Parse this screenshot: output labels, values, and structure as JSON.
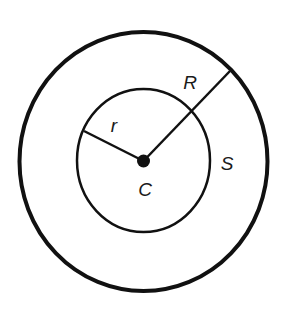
{
  "diagram": {
    "title": "",
    "colors": {
      "stroke": "#111111",
      "background": "#ffffff",
      "label": "#1a1a1a"
    },
    "outer_circle": {
      "name": "S",
      "cx": 143.5,
      "cy": 161.5,
      "rx": 124,
      "ry": 129.5,
      "stroke_width": 4
    },
    "inner_circle": {
      "cx": 143.5,
      "cy": 160.5,
      "rx": 66.5,
      "ry": 71.5,
      "stroke_width": 2.5
    },
    "center": {
      "label": "C",
      "cx": 143.5,
      "cy": 161,
      "r": 6.5
    },
    "segments": [
      {
        "label": "r",
        "x1": 143.5,
        "y1": 161,
        "x2": 84,
        "y2": 131
      },
      {
        "label": "R",
        "x1": 143.5,
        "y1": 161,
        "x2": 230,
        "y2": 71
      }
    ],
    "labels": {
      "r": {
        "text": "r",
        "x": 114,
        "y": 132
      },
      "R": {
        "text": "R",
        "x": 190,
        "y": 89
      },
      "S": {
        "text": "S",
        "x": 227,
        "y": 170
      },
      "C": {
        "text": "C",
        "x": 145,
        "y": 196
      }
    }
  }
}
